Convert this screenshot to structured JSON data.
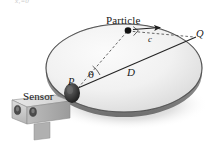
{
  "figure": {
    "top_fragment_text": "x₁=0",
    "background_color": "#ffffff",
    "labels": {
      "particle": "Particle",
      "sensor": "Sensor",
      "point_p": "P",
      "point_q": "Q",
      "diameter": "D",
      "chord_segment": "c",
      "angle": "θ"
    },
    "colors": {
      "disc_fill_light": "#f4f4f4",
      "disc_fill_mid": "#e2e2e2",
      "disc_rim": "#3a3a3a",
      "shadow": "#b9b9b9",
      "sensor_body": "#d6d6d6",
      "sensor_body_shade": "#a8a8a8",
      "sensor_lens": "#4a4a4a",
      "mount_dark": "#2b2b2b",
      "line_solid": "#2a2a2a",
      "line_dashed": "#555555",
      "label_text": "#1a1a1a"
    },
    "geometry": {
      "disc_center": [
        124,
        68
      ],
      "disc_rx": 78,
      "disc_ry": 44,
      "point_p": [
        77,
        88
      ],
      "point_q": [
        193,
        38
      ],
      "particle": [
        128,
        30
      ],
      "sensor_box": [
        10,
        97,
        60,
        32
      ]
    },
    "elements": [
      "disc-ellipse",
      "disc-shadow",
      "sensor-device",
      "sensor-mount-knob",
      "line-p-to-q-diameter",
      "dashed-line-p-to-particle",
      "dashed-line-particle-to-q",
      "right-angle-marker",
      "angle-arc-theta",
      "particle-dot",
      "velocity-arrow"
    ]
  }
}
